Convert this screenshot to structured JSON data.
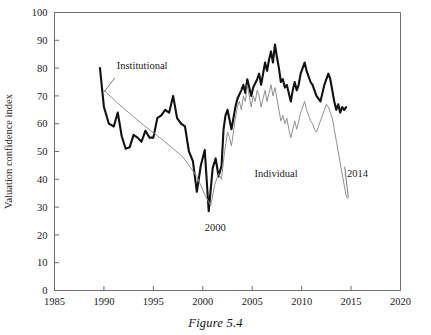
{
  "figure": {
    "caption": "Figure 5.4"
  },
  "chart_data": {
    "type": "line",
    "title": "",
    "xlabel": "",
    "ylabel": "Valuation confidence index",
    "xlim": [
      1985,
      2020
    ],
    "ylim": [
      0,
      100
    ],
    "xticks": [
      1985,
      1990,
      1995,
      2000,
      2005,
      2010,
      2015,
      2020
    ],
    "xtick_labels": [
      "1985",
      "1990",
      "1995",
      "2000",
      "2005",
      "2010",
      "2015",
      "2020"
    ],
    "yticks": [
      0,
      10,
      20,
      30,
      40,
      50,
      60,
      70,
      80,
      90,
      100
    ],
    "ytick_labels": [
      "0",
      "10",
      "20",
      "30",
      "40",
      "50",
      "60",
      "70",
      "80",
      "90",
      "100"
    ],
    "grid": false,
    "legend_position": "inline-annotation",
    "annotations": [
      {
        "name": "institutional-label",
        "text": "Institutional",
        "x": 1991.3,
        "y": 79.5
      },
      {
        "name": "trough-year-label",
        "text": "2000",
        "x": 2000.2,
        "y": 21.5
      },
      {
        "name": "individual-label",
        "text": "Individual",
        "x": 2009.6,
        "y": 41.0
      },
      {
        "name": "end-year-label",
        "text": "2014",
        "x": 2014.6,
        "y": 41.0
      }
    ],
    "series": [
      {
        "name": "Individual",
        "color": "#111111",
        "width": 2.1,
        "x": [
          1989.6,
          1990.0,
          1990.5,
          1991.0,
          1991.4,
          1991.8,
          1992.2,
          1992.6,
          1993.0,
          1993.4,
          1993.8,
          1994.2,
          1994.6,
          1995.0,
          1995.4,
          1995.8,
          1996.2,
          1996.6,
          1997.0,
          1997.4,
          1997.8,
          1998.2,
          1998.6,
          1999.0,
          1999.4,
          1999.8,
          2000.2,
          2000.6,
          2001.0,
          2001.3,
          2001.6,
          2001.9,
          2002.1,
          2002.3,
          2002.5,
          2002.7,
          2002.9,
          2003.1,
          2003.3,
          2003.5,
          2003.7,
          2003.9,
          2004.1,
          2004.3,
          2004.5,
          2004.7,
          2004.9,
          2005.1,
          2005.3,
          2005.5,
          2005.7,
          2005.9,
          2006.1,
          2006.3,
          2006.5,
          2006.7,
          2006.9,
          2007.1,
          2007.3,
          2007.5,
          2007.7,
          2007.9,
          2008.1,
          2008.3,
          2008.5,
          2008.7,
          2008.9,
          2009.1,
          2009.3,
          2009.5,
          2009.7,
          2009.9,
          2010.1,
          2010.3,
          2010.5,
          2010.7,
          2010.9,
          2011.1,
          2011.3,
          2011.5,
          2011.7,
          2011.9,
          2012.1,
          2012.3,
          2012.5,
          2012.7,
          2012.9,
          2013.1,
          2013.3,
          2013.5,
          2013.7,
          2013.9,
          2014.1,
          2014.3,
          2014.5
        ],
        "y": [
          80.0,
          66.0,
          60.0,
          59.0,
          64.0,
          55.5,
          51.0,
          51.5,
          56.0,
          55.0,
          53.5,
          57.5,
          55.0,
          55.0,
          62.0,
          63.0,
          65.0,
          64.0,
          70.0,
          62.0,
          60.0,
          59.0,
          50.0,
          46.5,
          35.5,
          45.0,
          50.5,
          28.5,
          44.0,
          47.5,
          41.0,
          45.0,
          58.0,
          63.0,
          65.0,
          61.5,
          58.0,
          62.0,
          66.0,
          69.0,
          70.5,
          72.0,
          74.0,
          71.0,
          76.0,
          73.0,
          70.0,
          73.0,
          74.5,
          76.0,
          78.0,
          74.0,
          78.0,
          82.0,
          79.0,
          83.0,
          86.0,
          82.0,
          88.5,
          84.0,
          80.0,
          75.0,
          76.0,
          73.0,
          74.0,
          71.0,
          68.0,
          72.0,
          75.0,
          72.0,
          74.0,
          78.0,
          80.0,
          82.0,
          79.0,
          77.0,
          75.0,
          74.0,
          72.0,
          70.0,
          69.0,
          68.0,
          71.0,
          74.0,
          76.0,
          78.0,
          76.0,
          72.0,
          68.0,
          65.0,
          67.0,
          64.0,
          66.0,
          65.0,
          66.0
        ]
      },
      {
        "name": "Institutional",
        "color": "#8a8a8a",
        "width": 0.95,
        "x": [
          1990.0,
          1992.0,
          1994.0,
          1996.0,
          1998.0,
          1999.4,
          2000.2,
          2000.8,
          2001.2,
          2001.6,
          2001.9,
          2002.1,
          2002.3,
          2002.5,
          2002.7,
          2002.9,
          2003.1,
          2003.3,
          2003.5,
          2003.7,
          2003.9,
          2004.1,
          2004.3,
          2004.5,
          2004.7,
          2004.9,
          2005.1,
          2005.3,
          2005.5,
          2005.7,
          2005.9,
          2006.1,
          2006.3,
          2006.5,
          2006.7,
          2006.9,
          2007.1,
          2007.3,
          2007.5,
          2007.7,
          2007.9,
          2008.1,
          2008.3,
          2008.5,
          2008.7,
          2008.9,
          2009.1,
          2009.3,
          2009.5,
          2009.7,
          2009.9,
          2010.1,
          2010.3,
          2010.5,
          2010.7,
          2010.9,
          2011.1,
          2011.3,
          2011.5,
          2011.7,
          2011.9,
          2012.1,
          2012.3,
          2012.5,
          2012.7,
          2012.9,
          2013.1,
          2013.3,
          2013.5,
          2013.7,
          2013.9,
          2014.1,
          2014.3,
          2014.5,
          2014.7
        ],
        "y": [
          72.0,
          65.5,
          59.5,
          54.0,
          48.0,
          41.0,
          34.5,
          30.5,
          38.0,
          42.0,
          40.0,
          47.0,
          52.0,
          57.0,
          55.0,
          52.0,
          57.0,
          62.0,
          66.0,
          68.0,
          65.0,
          70.0,
          68.0,
          74.0,
          70.0,
          66.0,
          70.0,
          68.0,
          72.0,
          70.0,
          66.0,
          69.0,
          72.0,
          68.0,
          71.0,
          74.0,
          70.0,
          73.0,
          69.0,
          65.0,
          61.0,
          63.0,
          60.0,
          62.0,
          58.0,
          55.0,
          58.0,
          61.0,
          58.0,
          61.0,
          64.0,
          66.0,
          68.0,
          65.0,
          63.0,
          61.0,
          60.0,
          58.0,
          57.0,
          59.0,
          61.0,
          63.0,
          65.0,
          67.0,
          66.0,
          64.0,
          62.0,
          58.0,
          54.0,
          50.0,
          46.0,
          42.0,
          38.0,
          34.0,
          33.0
        ]
      }
    ]
  }
}
